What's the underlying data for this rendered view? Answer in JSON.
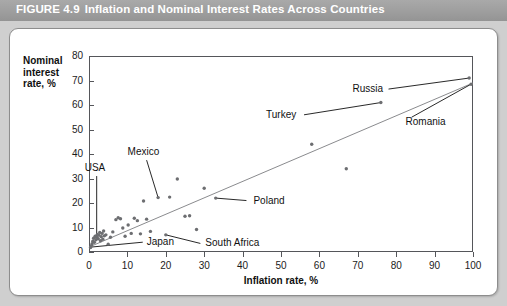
{
  "header": {
    "figure_number": "FIGURE 4.9",
    "title": "Inflation and Nominal Interest Rates Across Countries",
    "bar_color": "#9e9e9e",
    "text_color": "#ffffff"
  },
  "panel": {
    "background": "#ffffff",
    "border_color": "#8d8d8d",
    "page_background": "#cfcfcf"
  },
  "chart_data": {
    "type": "scatter",
    "title": "Inflation and Nominal Interest Rates Across Countries",
    "xlabel": "Inflation rate, %",
    "ylabel": "Nominal interest rate, %",
    "xlim": [
      0,
      100
    ],
    "ylim": [
      0,
      80
    ],
    "xticks": [
      0,
      10,
      20,
      30,
      40,
      50,
      60,
      70,
      80,
      90,
      100
    ],
    "yticks": [
      0,
      10,
      20,
      30,
      40,
      50,
      60,
      70,
      80
    ],
    "xtick_labels": [
      "0",
      "10",
      "20",
      "30",
      "40",
      "50",
      "60",
      "70",
      "80",
      "90",
      "100"
    ],
    "ytick_labels": [
      "0",
      "10",
      "20",
      "30",
      "40",
      "50",
      "60",
      "70",
      "80"
    ],
    "grid": false,
    "legend": null,
    "marker_color": "#6d6e71",
    "trendline": {
      "color": "#8a8b8e",
      "x": [
        0,
        100
      ],
      "y": [
        2.0,
        69.0
      ]
    },
    "points": [
      {
        "x": 0.4,
        "y": 1.8
      },
      {
        "x": 0.6,
        "y": 2.6
      },
      {
        "x": 0.8,
        "y": 3.4
      },
      {
        "x": 1.0,
        "y": 4.4
      },
      {
        "x": 1.2,
        "y": 5.6
      },
      {
        "x": 1.4,
        "y": 4.0
      },
      {
        "x": 1.6,
        "y": 6.4
      },
      {
        "x": 1.8,
        "y": 5.0
      },
      {
        "x": 2.0,
        "y": 6.0
      },
      {
        "x": 2.2,
        "y": 7.2
      },
      {
        "x": 2.4,
        "y": 5.4
      },
      {
        "x": 2.6,
        "y": 6.8
      },
      {
        "x": 2.8,
        "y": 8.0
      },
      {
        "x": 3.0,
        "y": 4.6
      },
      {
        "x": 3.2,
        "y": 6.2
      },
      {
        "x": 3.4,
        "y": 7.6
      },
      {
        "x": 3.6,
        "y": 5.2
      },
      {
        "x": 3.8,
        "y": 8.6
      },
      {
        "x": 4.0,
        "y": 6.6
      },
      {
        "x": 4.4,
        "y": 7.0
      },
      {
        "x": 5.0,
        "y": 3.2
      },
      {
        "x": 5.6,
        "y": 6.0
      },
      {
        "x": 6.2,
        "y": 8.2
      },
      {
        "x": 7.0,
        "y": 13.2
      },
      {
        "x": 7.6,
        "y": 14.0
      },
      {
        "x": 8.2,
        "y": 13.6
      },
      {
        "x": 8.8,
        "y": 9.8
      },
      {
        "x": 9.4,
        "y": 6.4
      },
      {
        "x": 10.2,
        "y": 11.0
      },
      {
        "x": 11.0,
        "y": 7.6
      },
      {
        "x": 11.8,
        "y": 13.8
      },
      {
        "x": 12.6,
        "y": 12.8
      },
      {
        "x": 13.4,
        "y": 7.4
      },
      {
        "x": 14.2,
        "y": 20.8
      },
      {
        "x": 15.0,
        "y": 13.4
      },
      {
        "x": 16.0,
        "y": 8.4
      },
      {
        "x": 18.0,
        "y": 22.2
      },
      {
        "x": 20.0,
        "y": 7.0
      },
      {
        "x": 21.0,
        "y": 22.4
      },
      {
        "x": 23.0,
        "y": 29.8
      },
      {
        "x": 25.0,
        "y": 14.6
      },
      {
        "x": 26.2,
        "y": 14.8
      },
      {
        "x": 28.0,
        "y": 9.2
      },
      {
        "x": 30.0,
        "y": 26.0
      },
      {
        "x": 33.0,
        "y": 22.0
      },
      {
        "x": 58.0,
        "y": 44.0
      },
      {
        "x": 67.0,
        "y": 34.0
      },
      {
        "x": 76.0,
        "y": 61.0
      },
      {
        "x": 99.0,
        "y": 71.0
      },
      {
        "x": 99.5,
        "y": 68.5
      }
    ],
    "annotations": [
      {
        "label": "USA",
        "point": {
          "x": 2.0,
          "y": 6.0
        },
        "label_pos": {
          "x": 2.0,
          "y": 31.0
        }
      },
      {
        "label": "Japan",
        "point": {
          "x": 0.5,
          "y": 2.0
        },
        "label_pos": {
          "x": 14.0,
          "y": 4.0
        }
      },
      {
        "label": "Mexico",
        "point": {
          "x": 18.0,
          "y": 22.2
        },
        "label_pos": {
          "x": 15.0,
          "y": 37.5
        }
      },
      {
        "label": "Poland",
        "point": {
          "x": 33.0,
          "y": 22.0
        },
        "label_pos": {
          "x": 41.0,
          "y": 21.0
        }
      },
      {
        "label": "South Africa",
        "point": {
          "x": 20.0,
          "y": 7.0
        },
        "label_pos": {
          "x": 29.0,
          "y": 3.5
        }
      },
      {
        "label": "Turkey",
        "point": {
          "x": 76.0,
          "y": 61.0
        },
        "label_pos": {
          "x": 56.0,
          "y": 56.0
        }
      },
      {
        "label": "Russia",
        "point": {
          "x": 99.0,
          "y": 71.0
        },
        "label_pos": {
          "x": 78.0,
          "y": 66.5
        }
      },
      {
        "label": "Romania",
        "point": {
          "x": 99.5,
          "y": 68.5
        },
        "label_pos": {
          "x": 84.0,
          "y": 55.0
        }
      }
    ]
  }
}
